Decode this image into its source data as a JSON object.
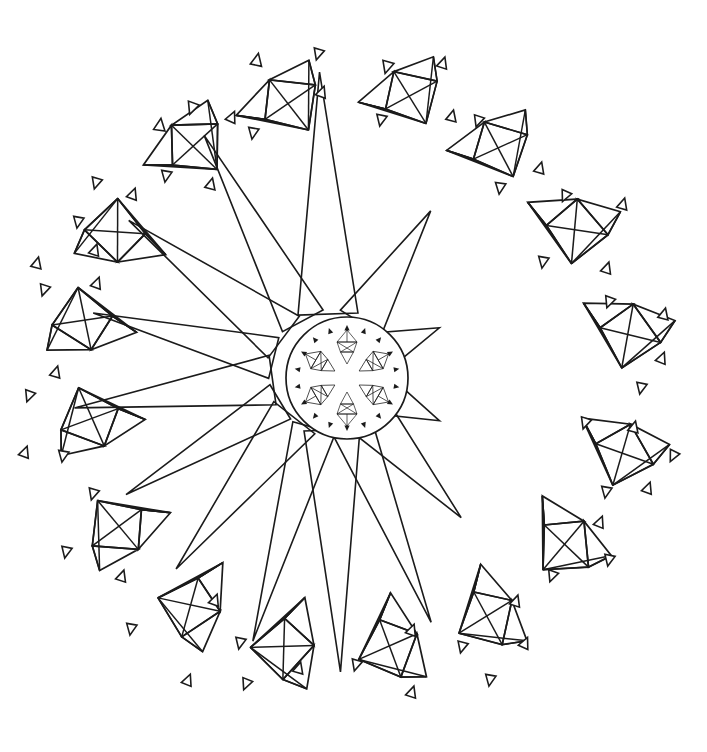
{
  "artwork": {
    "title": "Gem Burst Mandala",
    "style": "black-and-white line art coloring page",
    "canvas": {
      "width": 707,
      "height": 752
    },
    "background_color": "#ffffff",
    "line_color": "#1b1b1b",
    "line_width": 1.7
  },
  "center_medallion": {
    "name": "circular-medallion",
    "cx": 347,
    "cy": 378,
    "radius": 61,
    "inner_gem_count": 6,
    "inner_gem_radius": 33,
    "inner_gem_size": 26,
    "sparkle_ring_radius": 50,
    "sparkle_ring_count": 18,
    "sparkle_ring_size": 5
  },
  "burst": {
    "name": "radiating-triangle-burst",
    "origin_x": 330,
    "origin_y": 372,
    "spike_count": 14,
    "description": "long thin triangles radiating outward from behind the medallion, mostly toward the left and upper-left",
    "spikes": [
      {
        "angle": 92,
        "length": 300,
        "half_width": 30
      },
      {
        "angle": 118,
        "length": 268,
        "half_width": 23
      },
      {
        "angle": 143,
        "length": 252,
        "half_width": 26
      },
      {
        "angle": 166,
        "length": 244,
        "half_width": 21
      },
      {
        "angle": 188,
        "length": 258,
        "half_width": 25
      },
      {
        "angle": 211,
        "length": 238,
        "half_width": 20
      },
      {
        "angle": 232,
        "length": 250,
        "half_width": 26
      },
      {
        "angle": 254,
        "length": 280,
        "half_width": 22
      },
      {
        "angle": 272,
        "length": 300,
        "half_width": 28
      },
      {
        "angle": 292,
        "length": 270,
        "half_width": 21
      },
      {
        "angle": 312,
        "length": 196,
        "half_width": 24
      },
      {
        "angle": 336,
        "length": 120,
        "half_width": 20
      },
      {
        "angle": 22,
        "length": 118,
        "half_width": 19
      },
      {
        "angle": 58,
        "length": 190,
        "half_width": 24
      }
    ]
  },
  "gems": [
    {
      "id": "gem-top-left-1",
      "cx": 197,
      "cy": 145,
      "scale": 1.0,
      "rotation": 196
    },
    {
      "id": "gem-top-center",
      "cx": 292,
      "cy": 103,
      "scale": 1.0,
      "rotation": 204
    },
    {
      "id": "gem-top-right-1",
      "cx": 413,
      "cy": 96,
      "scale": 0.96,
      "rotation": 210
    },
    {
      "id": "gem-top-right-2",
      "cx": 502,
      "cy": 148,
      "scale": 0.97,
      "rotation": 214
    },
    {
      "id": "gem-right-upper",
      "cx": 578,
      "cy": 232,
      "scale": 1.02,
      "rotation": 247
    },
    {
      "id": "gem-right-mid",
      "cx": 631,
      "cy": 337,
      "scale": 1.02,
      "rotation": 252
    },
    {
      "id": "gem-right-lower",
      "cx": 625,
      "cy": 456,
      "scale": 1.0,
      "rotation": 258
    },
    {
      "id": "gem-right-bottom",
      "cx": 566,
      "cy": 548,
      "scale": 1.0,
      "rotation": 282
    },
    {
      "id": "gem-bottom-right",
      "cx": 487,
      "cy": 620,
      "scale": 0.98,
      "rotation": 300
    },
    {
      "id": "gem-bottom-mid-r",
      "cx": 389,
      "cy": 650,
      "scale": 1.0,
      "rotation": 308
    },
    {
      "id": "gem-bottom-mid-l",
      "cx": 282,
      "cy": 650,
      "scale": 1.0,
      "rotation": 330
    },
    {
      "id": "gem-bottom-left",
      "cx": 188,
      "cy": 608,
      "scale": 1.0,
      "rotation": 344
    },
    {
      "id": "gem-left-lower",
      "cx": 115,
      "cy": 527,
      "scale": 1.0,
      "rotation": 22
    },
    {
      "id": "gem-left-mid-2",
      "cx": 88,
      "cy": 418,
      "scale": 1.0,
      "rotation": 38
    },
    {
      "id": "gem-left-mid-1",
      "cx": 81,
      "cy": 319,
      "scale": 1.0,
      "rotation": 50
    },
    {
      "id": "gem-left-upper",
      "cx": 114,
      "cy": 230,
      "scale": 1.0,
      "rotation": 62
    }
  ],
  "sparkles": [
    {
      "x": 160,
      "y": 125,
      "size": 11,
      "rotation": 8
    },
    {
      "x": 192,
      "y": 108,
      "size": 11,
      "rotation": 200
    },
    {
      "x": 232,
      "y": 117,
      "size": 10,
      "rotation": 24
    },
    {
      "x": 166,
      "y": 176,
      "size": 10,
      "rotation": 190
    },
    {
      "x": 211,
      "y": 184,
      "size": 10,
      "rotation": 14
    },
    {
      "x": 257,
      "y": 60,
      "size": 11,
      "rotation": 12
    },
    {
      "x": 318,
      "y": 54,
      "size": 10,
      "rotation": 196
    },
    {
      "x": 253,
      "y": 133,
      "size": 10,
      "rotation": 190
    },
    {
      "x": 322,
      "y": 92,
      "size": 10,
      "rotation": 20
    },
    {
      "x": 387,
      "y": 67,
      "size": 11,
      "rotation": 196
    },
    {
      "x": 443,
      "y": 63,
      "size": 10,
      "rotation": 18
    },
    {
      "x": 381,
      "y": 120,
      "size": 10,
      "rotation": 192
    },
    {
      "x": 452,
      "y": 116,
      "size": 10,
      "rotation": 14
    },
    {
      "x": 478,
      "y": 121,
      "size": 10,
      "rotation": 198
    },
    {
      "x": 540,
      "y": 168,
      "size": 10,
      "rotation": 16
    },
    {
      "x": 500,
      "y": 188,
      "size": 10,
      "rotation": 188
    },
    {
      "x": 565,
      "y": 196,
      "size": 10,
      "rotation": 204
    },
    {
      "x": 623,
      "y": 204,
      "size": 10,
      "rotation": 16
    },
    {
      "x": 543,
      "y": 262,
      "size": 10,
      "rotation": 190
    },
    {
      "x": 607,
      "y": 268,
      "size": 10,
      "rotation": 18
    },
    {
      "x": 609,
      "y": 302,
      "size": 10,
      "rotation": 200
    },
    {
      "x": 664,
      "y": 314,
      "size": 10,
      "rotation": 14
    },
    {
      "x": 662,
      "y": 358,
      "size": 10,
      "rotation": 22
    },
    {
      "x": 641,
      "y": 388,
      "size": 10,
      "rotation": 192
    },
    {
      "x": 585,
      "y": 423,
      "size": 10,
      "rotation": 198
    },
    {
      "x": 634,
      "y": 427,
      "size": 10,
      "rotation": 14
    },
    {
      "x": 673,
      "y": 456,
      "size": 10,
      "rotation": 206
    },
    {
      "x": 606,
      "y": 492,
      "size": 10,
      "rotation": 190
    },
    {
      "x": 648,
      "y": 488,
      "size": 10,
      "rotation": 20
    },
    {
      "x": 600,
      "y": 522,
      "size": 10,
      "rotation": 22
    },
    {
      "x": 609,
      "y": 560,
      "size": 10,
      "rotation": 192
    },
    {
      "x": 552,
      "y": 576,
      "size": 10,
      "rotation": 200
    },
    {
      "x": 516,
      "y": 601,
      "size": 10,
      "rotation": 18
    },
    {
      "x": 525,
      "y": 643,
      "size": 10,
      "rotation": 24
    },
    {
      "x": 462,
      "y": 647,
      "size": 10,
      "rotation": 194
    },
    {
      "x": 490,
      "y": 680,
      "size": 10,
      "rotation": 190
    },
    {
      "x": 356,
      "y": 665,
      "size": 10,
      "rotation": 196
    },
    {
      "x": 412,
      "y": 692,
      "size": 10,
      "rotation": 18
    },
    {
      "x": 412,
      "y": 630,
      "size": 10,
      "rotation": 20
    },
    {
      "x": 240,
      "y": 643,
      "size": 10,
      "rotation": 192
    },
    {
      "x": 299,
      "y": 668,
      "size": 10,
      "rotation": 16
    },
    {
      "x": 246,
      "y": 684,
      "size": 10,
      "rotation": 202
    },
    {
      "x": 131,
      "y": 629,
      "size": 10,
      "rotation": 190
    },
    {
      "x": 188,
      "y": 680,
      "size": 10,
      "rotation": 22
    },
    {
      "x": 215,
      "y": 600,
      "size": 10,
      "rotation": 20
    },
    {
      "x": 66,
      "y": 552,
      "size": 10,
      "rotation": 192
    },
    {
      "x": 122,
      "y": 576,
      "size": 10,
      "rotation": 18
    },
    {
      "x": 93,
      "y": 494,
      "size": 10,
      "rotation": 196
    },
    {
      "x": 63,
      "y": 456,
      "size": 10,
      "rotation": 190
    },
    {
      "x": 25,
      "y": 452,
      "size": 10,
      "rotation": 20
    },
    {
      "x": 29,
      "y": 396,
      "size": 10,
      "rotation": 200
    },
    {
      "x": 56,
      "y": 372,
      "size": 10,
      "rotation": 16
    },
    {
      "x": 44,
      "y": 290,
      "size": 10,
      "rotation": 198
    },
    {
      "x": 97,
      "y": 283,
      "size": 10,
      "rotation": 20
    },
    {
      "x": 37,
      "y": 263,
      "size": 10,
      "rotation": 14
    },
    {
      "x": 96,
      "y": 183,
      "size": 10,
      "rotation": 196
    },
    {
      "x": 133,
      "y": 194,
      "size": 10,
      "rotation": 20
    },
    {
      "x": 78,
      "y": 222,
      "size": 10,
      "rotation": 190
    },
    {
      "x": 95,
      "y": 250,
      "size": 10,
      "rotation": 18
    }
  ]
}
